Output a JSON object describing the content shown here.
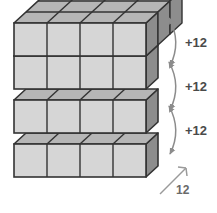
{
  "figure": {
    "background_color": "#ffffff"
  },
  "geometry": {
    "layers": 4,
    "cubes_wide": 4,
    "cubes_deep": 3,
    "cube_width": 33,
    "cube_height": 33,
    "depth_dx": 12,
    "depth_dy": -11,
    "layer_step_y": 44,
    "origin_x": 14,
    "origin_y": 177
  },
  "colors": {
    "top_face": "#b6b6b6",
    "front_face": "#d6d6d6",
    "side_face": "#8d8d8d",
    "edge": "#333333",
    "annotation": "#8c8c8c",
    "label_text": "#4a4a4a",
    "dim_text": "#6a6a6a"
  },
  "annotations": {
    "braces": [
      {
        "label": "+12"
      },
      {
        "label": "+12"
      },
      {
        "label": "+12"
      }
    ],
    "dimension": {
      "label": "12"
    }
  }
}
